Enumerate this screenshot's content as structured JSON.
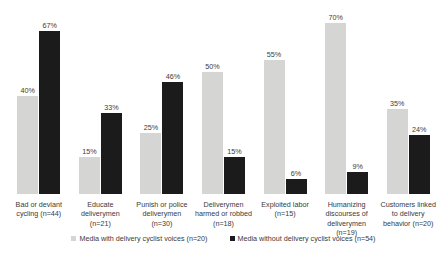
{
  "chart_data": {
    "type": "bar",
    "title": "",
    "xlabel": "",
    "ylabel": "",
    "ylim": [
      0,
      75
    ],
    "grid": false,
    "legend_position": "bottom",
    "categories": [
      "Bad or deviant cycling (n=44)",
      "Educate deliverymen (n=21)",
      "Punish or police deliverymen (n=30)",
      "Deliverymen harmed or robbed (n=18)",
      "Exploited labor (n=15)",
      "Humanizing discourses of deliverymen (n=19)",
      "Customers linked to delivery behavior (n=20)"
    ],
    "series": [
      {
        "name": "Media with delivery cyclist voices (n=20)",
        "color": "#d5d6d4",
        "values": [
          40,
          15,
          25,
          50,
          55,
          70,
          35
        ],
        "labels": [
          "40%",
          "15%",
          "25%",
          "50%",
          "55%",
          "70%",
          "35%"
        ]
      },
      {
        "name": "Media without delivery cyclist voices (n=54)",
        "color": "#1b1b1b",
        "values": [
          67,
          33,
          46,
          15,
          6,
          9,
          24
        ],
        "labels": [
          "67%",
          "33%",
          "46%",
          "15%",
          "6%",
          "9%",
          "24%"
        ]
      }
    ]
  },
  "legend": {
    "items": [
      {
        "label": "Media with delivery cyclist voices (n=20)",
        "swatch": "light-square-icon"
      },
      {
        "label": "Media without delivery cyclist voices (n=54)",
        "swatch": "dark-square-icon"
      }
    ]
  }
}
